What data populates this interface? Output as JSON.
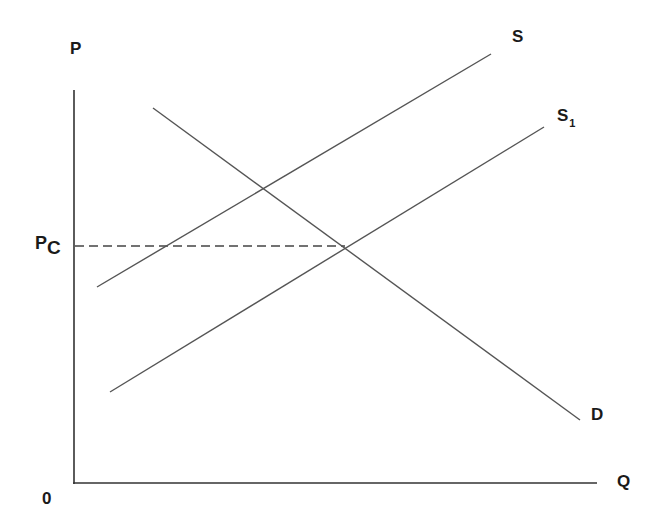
{
  "diagram": {
    "type": "supply-demand",
    "axes": {
      "y_label": "P",
      "x_label": "Q",
      "origin_label": "0"
    },
    "price_marker": {
      "label_main": "P",
      "label_sub": "C"
    },
    "curves": [
      {
        "name": "S",
        "label_main": "S",
        "label_sub": "",
        "style": "solid",
        "from": [
          97,
          287
        ],
        "to": [
          491,
          54
        ]
      },
      {
        "name": "S1",
        "label_main": "S",
        "label_sub": "1",
        "style": "solid",
        "from": [
          110,
          392
        ],
        "to": [
          544,
          127
        ]
      },
      {
        "name": "D",
        "label_main": "D",
        "label_sub": "",
        "style": "solid",
        "from": [
          153,
          108
        ],
        "to": [
          580,
          420
        ]
      }
    ],
    "guide_lines": [
      {
        "name": "Pc-dashed",
        "style": "dashed",
        "from": [
          74,
          246
        ],
        "to": [
          345,
          246
        ]
      }
    ],
    "colors": {
      "line": "#555555",
      "axis": "#333333",
      "text": "#1a1a1a"
    }
  }
}
